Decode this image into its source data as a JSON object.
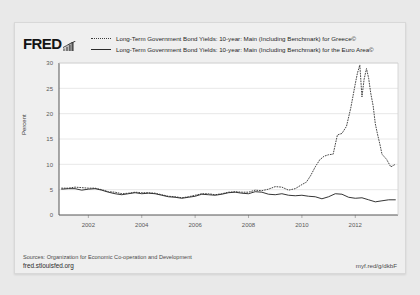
{
  "card": {
    "logo_text": "FRED",
    "logo_glyph": "bar-chart-icon"
  },
  "legend": {
    "items": [
      {
        "style": "dotted",
        "label": "Long-Term Government Bond Yields: 10-year: Main (Including Benchmark) for Greece©"
      },
      {
        "style": "solid",
        "label": "Long-Term Government Bond Yields: 10-year: Main (Including Benchmark) for the Euro Area©"
      }
    ]
  },
  "footer": {
    "source": "Sources: Organization for Economic Co-operation and Development",
    "site_url": "fred.stlouisfed.org",
    "short_url": "myf.red/g/dkbF"
  },
  "chart_data": {
    "type": "line",
    "title": "",
    "xlabel": "",
    "ylabel": "Percent",
    "ylim": [
      0,
      30
    ],
    "xlim": [
      2000.9,
      2013.6
    ],
    "yticks": [
      0,
      5,
      10,
      15,
      20,
      25,
      30
    ],
    "xticks": [
      2002,
      2004,
      2006,
      2008,
      2010,
      2012
    ],
    "grid": true,
    "legend_position": "top",
    "series": [
      {
        "name": "Long-Term Government Bond Yields: 10-year: Main (Including Benchmark) for Greece©",
        "style": "dotted",
        "color": "#3c3c3c",
        "x": [
          2001.0,
          2001.25,
          2001.5,
          2001.75,
          2002.0,
          2002.25,
          2002.5,
          2002.75,
          2003.0,
          2003.25,
          2003.5,
          2003.75,
          2004.0,
          2004.25,
          2004.5,
          2004.75,
          2005.0,
          2005.25,
          2005.5,
          2005.75,
          2006.0,
          2006.25,
          2006.5,
          2006.75,
          2007.0,
          2007.25,
          2007.5,
          2007.75,
          2008.0,
          2008.25,
          2008.5,
          2008.75,
          2009.0,
          2009.25,
          2009.5,
          2009.75,
          2010.0,
          2010.17,
          2010.33,
          2010.5,
          2010.67,
          2010.83,
          2011.0,
          2011.17,
          2011.33,
          2011.5,
          2011.67,
          2011.83,
          2012.0,
          2012.08,
          2012.17,
          2012.25,
          2012.33,
          2012.42,
          2012.5,
          2012.58,
          2012.67,
          2012.75,
          2012.83,
          2012.92,
          2013.0,
          2013.17,
          2013.33,
          2013.5
        ],
        "values": [
          5.3,
          5.3,
          5.5,
          5.4,
          5.3,
          5.3,
          5.0,
          4.6,
          4.5,
          4.2,
          4.3,
          4.5,
          4.4,
          4.4,
          4.3,
          4.0,
          3.7,
          3.6,
          3.4,
          3.6,
          3.9,
          4.2,
          4.2,
          4.0,
          4.2,
          4.5,
          4.6,
          4.5,
          4.5,
          4.9,
          4.8,
          5.1,
          5.6,
          5.5,
          4.9,
          5.2,
          6.0,
          6.5,
          7.8,
          9.5,
          10.9,
          11.6,
          11.9,
          12.0,
          15.8,
          16.1,
          17.5,
          21.1,
          25.9,
          28.0,
          29.6,
          23.3,
          26.8,
          28.9,
          27.0,
          24.0,
          21.5,
          18.0,
          16.0,
          14.0,
          12.0,
          11.0,
          9.5,
          10.0
        ]
      },
      {
        "name": "Long-Term Government Bond Yields: 10-year: Main (Including Benchmark) for the Euro Area©",
        "style": "solid",
        "color": "#2b2b2b",
        "x": [
          2001.0,
          2001.25,
          2001.5,
          2001.75,
          2002.0,
          2002.25,
          2002.5,
          2002.75,
          2003.0,
          2003.25,
          2003.5,
          2003.75,
          2004.0,
          2004.25,
          2004.5,
          2004.75,
          2005.0,
          2005.25,
          2005.5,
          2005.75,
          2006.0,
          2006.25,
          2006.5,
          2006.75,
          2007.0,
          2007.25,
          2007.5,
          2007.75,
          2008.0,
          2008.25,
          2008.5,
          2008.75,
          2009.0,
          2009.25,
          2009.5,
          2009.75,
          2010.0,
          2010.25,
          2010.5,
          2010.75,
          2011.0,
          2011.25,
          2011.5,
          2011.75,
          2012.0,
          2012.25,
          2012.5,
          2012.75,
          2013.0,
          2013.25,
          2013.5
        ],
        "values": [
          5.1,
          5.2,
          5.2,
          4.9,
          5.1,
          5.2,
          4.9,
          4.5,
          4.2,
          4.0,
          4.2,
          4.4,
          4.2,
          4.3,
          4.2,
          3.9,
          3.6,
          3.5,
          3.3,
          3.5,
          3.7,
          4.1,
          4.0,
          3.9,
          4.1,
          4.4,
          4.5,
          4.3,
          4.2,
          4.6,
          4.5,
          4.1,
          4.0,
          4.2,
          3.9,
          3.8,
          3.9,
          3.7,
          3.6,
          3.2,
          3.6,
          4.2,
          4.1,
          3.5,
          3.3,
          3.4,
          3.0,
          2.6,
          2.8,
          3.0,
          3.0
        ]
      }
    ]
  }
}
